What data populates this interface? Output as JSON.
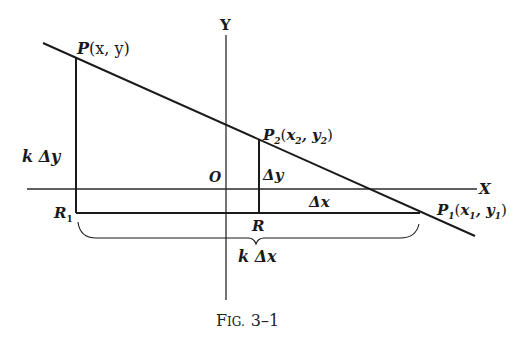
{
  "figure": {
    "caption": "Fig. 3–1",
    "caption_big": "F",
    "caption_small": "IG.",
    "caption_num": "3–1"
  },
  "axes": {
    "x_label": "X",
    "y_label": "Y",
    "origin_label": "O"
  },
  "points": {
    "P": {
      "name": "P",
      "coords": "(x, y)"
    },
    "P1": {
      "name": "P",
      "sub": "1",
      "coords_open": "(x",
      "coords_sub1": "1",
      "coords_mid": ", y",
      "coords_sub2": "1",
      "coords_close": ")"
    },
    "P2": {
      "name": "P",
      "sub": "2",
      "coords_open": "(x",
      "coords_sub1": "2",
      "coords_mid": ", y",
      "coords_sub2": "2",
      "coords_close": ")"
    },
    "R": {
      "name": "R"
    },
    "R1": {
      "name": "R",
      "sub": "1"
    }
  },
  "segments": {
    "dy_label": "Δy",
    "dx_label": "Δx",
    "k_dy_label": "k Δy",
    "k_dx_label": "k Δx"
  },
  "colors": {
    "ink": "#1a1a1a",
    "background": "#ffffff"
  }
}
